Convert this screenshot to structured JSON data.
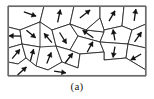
{
  "figure": {
    "label": "polycrystalline-grain-structure",
    "caption": "(a)",
    "frame": {
      "x": 8,
      "y": 6,
      "width": 138,
      "height": 70
    },
    "colors": {
      "background": "#ffffff",
      "grain_boundary": "#2b2b2b",
      "frame_border": "#6b6b6b",
      "arrow": "#111111"
    },
    "grain_count": 21,
    "arrow_count": 21
  },
  "chart_data": {
    "type": "diagram",
    "title": "(a)",
    "grains": [
      {
        "id": "g1",
        "polygon": "8,6 44,6 40,22 20,30 8,27"
      },
      {
        "id": "g2",
        "polygon": "44,6 74,6 70,24 52,30 40,22"
      },
      {
        "id": "g3",
        "polygon": "74,6 100,6 100,18 86,30 70,24"
      },
      {
        "id": "g4",
        "polygon": "100,6 124,6 122,26 104,30 100,18"
      },
      {
        "id": "g5",
        "polygon": "124,6 146,6 146,24 132,30 122,26"
      },
      {
        "id": "g6",
        "polygon": "8,27 20,30 22,44 8,48"
      },
      {
        "id": "g7",
        "polygon": "20,30 40,22 44,40 40,47 22,44"
      },
      {
        "id": "g8",
        "polygon": "40,22 52,30 56,46 44,54 40,47"
      },
      {
        "id": "g9",
        "polygon": "52,30 70,24 78,36 70,50 56,46"
      },
      {
        "id": "g10",
        "polygon": "70,24 86,30 104,32 100,42 78,36"
      },
      {
        "id": "g11",
        "polygon": "86,30 100,18 104,30 104,32"
      },
      {
        "id": "g12",
        "polygon": "104,30 122,26 132,30 128,44 100,42 104,32"
      },
      {
        "id": "g13",
        "polygon": "132,30 146,24 146,48 128,44"
      },
      {
        "id": "g14",
        "polygon": "8,48 22,44 26,58 18,64 8,62"
      },
      {
        "id": "g15",
        "polygon": "22,44 40,47 44,54 36,66 26,58"
      },
      {
        "id": "g16",
        "polygon": "40,47 56,46 62,62 48,70 36,66"
      },
      {
        "id": "g17",
        "polygon": "56,46 70,50 80,54 78,68 62,62"
      },
      {
        "id": "g18",
        "polygon": "70,50 78,36 100,42 104,52 80,54"
      },
      {
        "id": "g19",
        "polygon": "100,42 128,44 126,58 104,60 104,52"
      },
      {
        "id": "g20",
        "polygon": "128,44 146,48 146,70 126,58"
      },
      {
        "id": "g21",
        "polygon": "8,62 18,64 26,58 36,66 48,70 62,62 78,68 80,54 104,52 104,60 126,58 146,70 146,76 8,76"
      }
    ],
    "orientation_arrows": [
      {
        "grain": "g1",
        "x": 30,
        "y": 14,
        "angle": 20,
        "length": 13
      },
      {
        "grain": "g2",
        "x": 59,
        "y": 16,
        "angle": -78,
        "length": 13
      },
      {
        "grain": "g3",
        "x": 85,
        "y": 14,
        "angle": -38,
        "length": 13
      },
      {
        "grain": "g4",
        "x": 112,
        "y": 16,
        "angle": -60,
        "length": 12
      },
      {
        "grain": "g5",
        "x": 135,
        "y": 15,
        "angle": -82,
        "length": 12
      },
      {
        "grain": "g6",
        "x": 15,
        "y": 36,
        "angle": 182,
        "length": 12
      },
      {
        "grain": "g7",
        "x": 31,
        "y": 34,
        "angle": 40,
        "length": 12
      },
      {
        "grain": "g8",
        "x": 48,
        "y": 38,
        "angle": -130,
        "length": 12
      },
      {
        "grain": "g9",
        "x": 63,
        "y": 38,
        "angle": 58,
        "length": 13
      },
      {
        "grain": "g10",
        "x": 88,
        "y": 34,
        "angle": -145,
        "length": 13
      },
      {
        "grain": "g12",
        "x": 114,
        "y": 35,
        "angle": -100,
        "length": 11
      },
      {
        "grain": "g13",
        "x": 138,
        "y": 37,
        "angle": -55,
        "length": 12
      },
      {
        "grain": "g14",
        "x": 16,
        "y": 54,
        "angle": -50,
        "length": 12
      },
      {
        "grain": "g15",
        "x": 32,
        "y": 55,
        "angle": -75,
        "length": 12
      },
      {
        "grain": "g16",
        "x": 49,
        "y": 58,
        "angle": -68,
        "length": 12
      },
      {
        "grain": "g17",
        "x": 69,
        "y": 58,
        "angle": -52,
        "length": 12
      },
      {
        "grain": "g18",
        "x": 90,
        "y": 47,
        "angle": -62,
        "length": 12
      },
      {
        "grain": "g19",
        "x": 114,
        "y": 52,
        "angle": 100,
        "length": 11
      },
      {
        "grain": "g20",
        "x": 136,
        "y": 57,
        "angle": 150,
        "length": 12
      },
      {
        "grain": "g21",
        "x": 22,
        "y": 71,
        "angle": -42,
        "length": 12
      },
      {
        "grain": "g21b",
        "x": 60,
        "y": 72,
        "angle": 8,
        "length": 12
      }
    ],
    "xlabel": "",
    "ylabel": "",
    "legend": []
  }
}
